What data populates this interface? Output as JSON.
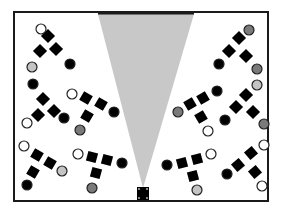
{
  "canvas": {
    "width": 284,
    "height": 217,
    "background": "#ffffff"
  },
  "colors": {
    "frame": "#1a1a1a",
    "cone": "#c8c8c8",
    "desk": "#000000",
    "seat_stroke": "#222222",
    "seat_white": "#ffffff",
    "seat_light": "#c4c4c4",
    "seat_dark": "#7a7a7a",
    "seat_black": "#000000"
  },
  "room": {
    "x": 14,
    "y": 12,
    "w": 254,
    "h": 189,
    "stroke_width": 2
  },
  "wall_bar": {
    "x1": 98,
    "x2": 194,
    "y": 13,
    "stroke_width": 3
  },
  "camera": {
    "x": 137,
    "y": 187,
    "w": 12,
    "h": 13,
    "cone": {
      "top_left": 98,
      "top_right": 194,
      "top_y": 14,
      "apex_x": 143,
      "apex_y": 188
    }
  },
  "groups": [
    {
      "name": "left-top",
      "desks": [
        {
          "x": 48,
          "y": 36,
          "size": 10,
          "rot": 45
        },
        {
          "x": 40,
          "y": 51,
          "size": 10,
          "rot": 45
        },
        {
          "x": 56,
          "y": 49,
          "size": 10,
          "rot": 45
        }
      ],
      "seats": [
        {
          "x": 41,
          "y": 29,
          "r": 5,
          "fill": "white"
        },
        {
          "x": 32,
          "y": 67,
          "r": 5,
          "fill": "light"
        },
        {
          "x": 70,
          "y": 64,
          "r": 5,
          "fill": "black"
        }
      ]
    },
    {
      "name": "left-middle",
      "desks": [
        {
          "x": 43,
          "y": 99,
          "size": 10,
          "rot": 45
        },
        {
          "x": 38,
          "y": 115,
          "size": 10,
          "rot": 45
        },
        {
          "x": 54,
          "y": 111,
          "size": 10,
          "rot": 45
        }
      ],
      "seats": [
        {
          "x": 33,
          "y": 84,
          "r": 5,
          "fill": "black"
        },
        {
          "x": 27,
          "y": 123,
          "r": 5,
          "fill": "white"
        },
        {
          "x": 64,
          "y": 118,
          "r": 5,
          "fill": "black"
        }
      ]
    },
    {
      "name": "left-center",
      "desks": [
        {
          "x": 86,
          "y": 98,
          "size": 10,
          "rot": 30
        },
        {
          "x": 101,
          "y": 104,
          "size": 10,
          "rot": 30
        },
        {
          "x": 87,
          "y": 116,
          "size": 10,
          "rot": 30
        }
      ],
      "seats": [
        {
          "x": 72,
          "y": 94,
          "r": 5,
          "fill": "white"
        },
        {
          "x": 114,
          "y": 112,
          "r": 5,
          "fill": "black"
        },
        {
          "x": 80,
          "y": 130,
          "r": 5,
          "fill": "dark"
        }
      ]
    },
    {
      "name": "left-bottom",
      "desks": [
        {
          "x": 37,
          "y": 155,
          "size": 10,
          "rot": 30
        },
        {
          "x": 50,
          "y": 163,
          "size": 10,
          "rot": 30
        },
        {
          "x": 33,
          "y": 172,
          "size": 10,
          "rot": 30
        }
      ],
      "seats": [
        {
          "x": 24,
          "y": 146,
          "r": 5,
          "fill": "white"
        },
        {
          "x": 62,
          "y": 171,
          "r": 5,
          "fill": "light"
        },
        {
          "x": 27,
          "y": 185,
          "r": 5,
          "fill": "black"
        }
      ]
    },
    {
      "name": "left-bottom-center",
      "desks": [
        {
          "x": 92,
          "y": 157,
          "size": 10,
          "rot": 15
        },
        {
          "x": 107,
          "y": 160,
          "size": 10,
          "rot": 15
        },
        {
          "x": 96,
          "y": 173,
          "size": 10,
          "rot": 15
        }
      ],
      "seats": [
        {
          "x": 78,
          "y": 154,
          "r": 5,
          "fill": "white"
        },
        {
          "x": 122,
          "y": 163,
          "r": 5,
          "fill": "black"
        },
        {
          "x": 92,
          "y": 188,
          "r": 5,
          "fill": "dark"
        }
      ]
    },
    {
      "name": "right-top",
      "desks": [
        {
          "x": 239,
          "y": 38,
          "size": 10,
          "rot": 45
        },
        {
          "x": 229,
          "y": 51,
          "size": 10,
          "rot": 45
        },
        {
          "x": 246,
          "y": 56,
          "size": 10,
          "rot": 45
        }
      ],
      "seats": [
        {
          "x": 249,
          "y": 30,
          "r": 5,
          "fill": "dark"
        },
        {
          "x": 219,
          "y": 64,
          "r": 5,
          "fill": "black"
        },
        {
          "x": 257,
          "y": 69,
          "r": 5,
          "fill": "dark"
        }
      ]
    },
    {
      "name": "right-middle",
      "desks": [
        {
          "x": 246,
          "y": 95,
          "size": 10,
          "rot": 45
        },
        {
          "x": 236,
          "y": 107,
          "size": 10,
          "rot": 45
        },
        {
          "x": 253,
          "y": 112,
          "size": 10,
          "rot": 45
        }
      ],
      "seats": [
        {
          "x": 257,
          "y": 85,
          "r": 5,
          "fill": "light"
        },
        {
          "x": 225,
          "y": 120,
          "r": 5,
          "fill": "black"
        },
        {
          "x": 264,
          "y": 124,
          "r": 5,
          "fill": "dark"
        }
      ]
    },
    {
      "name": "right-center",
      "desks": [
        {
          "x": 190,
          "y": 104,
          "size": 10,
          "rot": -30
        },
        {
          "x": 203,
          "y": 98,
          "size": 10,
          "rot": -30
        },
        {
          "x": 201,
          "y": 117,
          "size": 10,
          "rot": -30
        }
      ],
      "seats": [
        {
          "x": 178,
          "y": 112,
          "r": 5,
          "fill": "dark"
        },
        {
          "x": 217,
          "y": 91,
          "r": 5,
          "fill": "black"
        },
        {
          "x": 208,
          "y": 131,
          "r": 5,
          "fill": "white"
        }
      ]
    },
    {
      "name": "right-bottom-center",
      "desks": [
        {
          "x": 182,
          "y": 163,
          "size": 10,
          "rot": -15
        },
        {
          "x": 197,
          "y": 159,
          "size": 10,
          "rot": -15
        },
        {
          "x": 193,
          "y": 176,
          "size": 10,
          "rot": -15
        }
      ],
      "seats": [
        {
          "x": 167,
          "y": 165,
          "r": 5,
          "fill": "black"
        },
        {
          "x": 211,
          "y": 154,
          "r": 5,
          "fill": "white"
        },
        {
          "x": 197,
          "y": 190,
          "r": 5,
          "fill": "light"
        }
      ]
    },
    {
      "name": "right-bottom",
      "desks": [
        {
          "x": 238,
          "y": 165,
          "size": 10,
          "rot": -40
        },
        {
          "x": 251,
          "y": 153,
          "size": 10,
          "rot": -40
        },
        {
          "x": 255,
          "y": 172,
          "size": 10,
          "rot": -40
        }
      ],
      "seats": [
        {
          "x": 227,
          "y": 174,
          "r": 5,
          "fill": "black"
        },
        {
          "x": 264,
          "y": 145,
          "r": 5,
          "fill": "white"
        },
        {
          "x": 262,
          "y": 186,
          "r": 5,
          "fill": "white"
        }
      ]
    }
  ]
}
